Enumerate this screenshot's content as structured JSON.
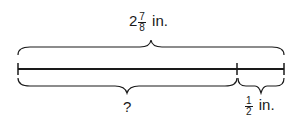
{
  "diagram": {
    "total_label": {
      "whole": "2",
      "numerator": "7",
      "denominator": "8",
      "unit": "in."
    },
    "unknown_label": "?",
    "part_label": {
      "numerator": "1",
      "denominator": "2",
      "unit": "in."
    },
    "colors": {
      "line": "#1a1a1a",
      "background": "#ffffff"
    }
  }
}
